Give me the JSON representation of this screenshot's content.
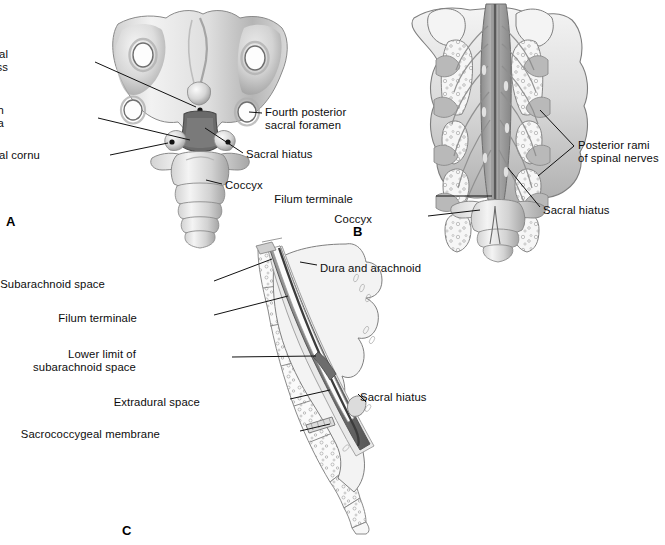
{
  "figure": {
    "type": "anatomical-illustration",
    "background_color": "#ffffff",
    "ink_color": "#0d0d0d",
    "bone_fill": "#efefef",
    "bone_shade": "#bdbdbd",
    "bone_dark": "#8f8f8f",
    "nerve_fill": "#9a9a9a",
    "dura_fill": "#6f6f6f",
    "caption": ""
  },
  "panels": [
    {
      "id": "A",
      "letter": "A",
      "title": "Posterior view of lower sacrum and coccyx",
      "labels": [
        {
          "key": "fourth_sacral_spinous_process",
          "lines": [
            "Fourth sacral",
            "spinous process"
          ],
          "align": "right",
          "x": 8,
          "y": 48
        },
        {
          "key": "lamina_of_fourth_sacral_vertebra",
          "lines": [
            "Lamina of fourth",
            "sacral vertebra"
          ],
          "align": "right",
          "x": 4,
          "y": 104
        },
        {
          "key": "sacral_cornu",
          "lines": [
            "Sacral cornu"
          ],
          "align": "right",
          "x": 40,
          "y": 149
        },
        {
          "key": "fourth_posterior_sacral_foramen",
          "lines": [
            "Fourth posterior",
            "sacral foramen"
          ],
          "align": "left",
          "x": 265,
          "y": 106
        },
        {
          "key": "sacral_hiatus",
          "lines": [
            "Sacral hiatus"
          ],
          "align": "left",
          "x": 246,
          "y": 148
        },
        {
          "key": "coccyx",
          "lines": [
            "Coccyx"
          ],
          "align": "left",
          "x": 225,
          "y": 179
        }
      ]
    },
    {
      "id": "B",
      "letter": "B",
      "title": "Sacral canal opened posteriorly showing spinal nerves",
      "labels": [
        {
          "key": "posterior_rami_of_spinal_nerves",
          "lines": [
            "Posterior rami",
            "of spinal nerves"
          ],
          "align": "left",
          "x": 578,
          "y": 139
        },
        {
          "key": "filum_terminale",
          "lines": [
            "Filum terminale"
          ],
          "align": "right",
          "x": 353,
          "y": 193
        },
        {
          "key": "coccyx",
          "lines": [
            "Coccyx"
          ],
          "align": "right",
          "x": 372,
          "y": 213
        },
        {
          "key": "sacral_hiatus",
          "lines": [
            "Sacral hiatus"
          ],
          "align": "left",
          "x": 543,
          "y": 204
        }
      ]
    },
    {
      "id": "C",
      "letter": "C",
      "title": "Sagittal section of sacrum and coccyx",
      "labels": [
        {
          "key": "subarachnoid_space",
          "lines": [
            "Subarachnoid space"
          ],
          "align": "right",
          "x": 105,
          "y": 278
        },
        {
          "key": "filum_terminale",
          "lines": [
            "Filum terminale"
          ],
          "align": "right",
          "x": 137,
          "y": 312
        },
        {
          "key": "lower_limit_of_subarachnoid_space",
          "lines": [
            "Lower limit of",
            "subarachnoid space"
          ],
          "align": "right",
          "x": 136,
          "y": 348
        },
        {
          "key": "extradural_space",
          "lines": [
            "Extradural space"
          ],
          "align": "right",
          "x": 200,
          "y": 396
        },
        {
          "key": "sacrococcygeal_membrane",
          "lines": [
            "Sacrococcygeal membrane"
          ],
          "align": "right",
          "x": 160,
          "y": 428
        },
        {
          "key": "dura_and_arachnoid",
          "lines": [
            "Dura and arachnoid"
          ],
          "align": "left",
          "x": 320,
          "y": 262
        },
        {
          "key": "sacral_hiatus",
          "lines": [
            "Sacral hiatus"
          ],
          "align": "left",
          "x": 360,
          "y": 391
        }
      ]
    }
  ],
  "panel_letters": [
    {
      "id": "A",
      "text": "A",
      "x": 6,
      "y": 214
    },
    {
      "id": "B",
      "text": "B",
      "x": 353,
      "y": 224
    },
    {
      "id": "C",
      "text": "C",
      "x": 122,
      "y": 523
    }
  ]
}
